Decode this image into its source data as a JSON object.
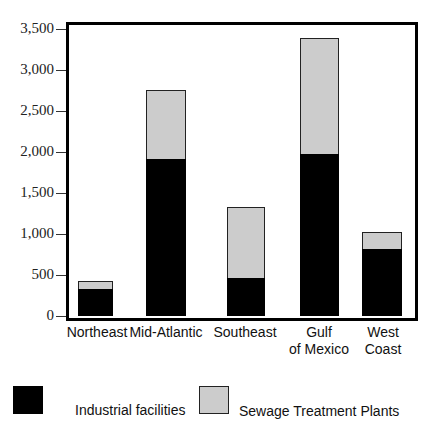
{
  "chart_data": {
    "type": "bar",
    "stacked": true,
    "title": "",
    "xlabel": "",
    "ylabel": "",
    "ylim": [
      0,
      3500
    ],
    "yticks": [
      0,
      500,
      1000,
      1500,
      2000,
      2500,
      3000,
      3500
    ],
    "ytick_labels": [
      "0",
      "500",
      "1,000",
      "1,500",
      "2,000",
      "2,500",
      "3,000",
      "3,500"
    ],
    "categories": [
      "Northeast",
      "Mid-Atlantic",
      "Southeast",
      "Gulf\nof Mexico",
      "West\nCoast"
    ],
    "series": [
      {
        "name": "Industrial facilities",
        "color": "#000000",
        "values": [
          330,
          1910,
          465,
          1975,
          820
        ]
      },
      {
        "name": "Sewage Treatment Plants",
        "color": "#cccccc",
        "values": [
          95,
          850,
          865,
          1415,
          205
        ]
      }
    ],
    "totals": [
      425,
      2760,
      1330,
      3390,
      1025
    ],
    "grid": false,
    "legend_position": "bottom"
  },
  "legend": {
    "items": [
      {
        "label": "Industrial facilities",
        "color": "#000000"
      },
      {
        "label": "Sewage Treatment Plants",
        "color": "#cccccc"
      }
    ]
  }
}
